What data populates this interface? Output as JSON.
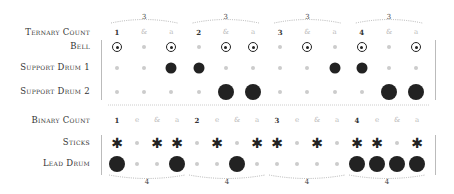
{
  "ternary": {
    "count_label": "Ternary Count",
    "counts": [
      "1",
      "&",
      "a",
      "2",
      "&",
      "a",
      "3",
      "&",
      "a",
      "4",
      "&",
      "a"
    ],
    "group_label": "3",
    "rows": [
      {
        "label": "Bell",
        "type": "bell",
        "pattern": [
          1,
          0,
          1,
          0,
          1,
          1,
          0,
          1,
          0,
          1,
          0,
          1
        ]
      },
      {
        "label": "Support Drum 1",
        "type": "hit",
        "pattern": [
          0,
          0,
          1,
          1,
          0,
          0,
          0,
          0,
          1,
          1,
          0,
          0
        ]
      },
      {
        "label": "Support Drum 2",
        "type": "big",
        "pattern": [
          0,
          0,
          0,
          0,
          1,
          1,
          0,
          0,
          0,
          0,
          1,
          1
        ]
      }
    ]
  },
  "binary": {
    "count_label": "Binary Count",
    "counts": [
      "1",
      "e",
      "&",
      "a",
      "2",
      "e",
      "&",
      "a",
      "3",
      "e",
      "&",
      "a",
      "4",
      "e",
      "&",
      "a"
    ],
    "group_label": "4",
    "rows": [
      {
        "label": "Sticks",
        "type": "star",
        "pattern": [
          1,
          0,
          1,
          1,
          0,
          1,
          0,
          1,
          1,
          0,
          1,
          0,
          1,
          1,
          0,
          1
        ]
      },
      {
        "label": "Lead Drum",
        "type": "big",
        "pattern": [
          1,
          0,
          0,
          1,
          0,
          0,
          1,
          0,
          0,
          0,
          0,
          0,
          1,
          1,
          1,
          1
        ]
      }
    ]
  },
  "icons": {
    "star": "✱"
  }
}
